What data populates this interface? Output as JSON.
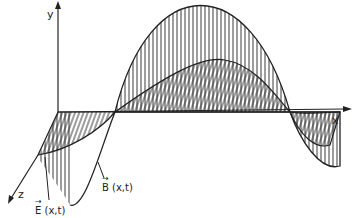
{
  "diagram": {
    "axes": {
      "x_label": "x",
      "y_label": "y",
      "z_label": "z"
    },
    "labels": {
      "E_field": "E (x,t)",
      "B_field": "B (x,t)",
      "E_vector_mark": "→",
      "B_vector_mark": "→"
    },
    "colors": {
      "ink": "#222222",
      "background": "#ffffff"
    }
  }
}
